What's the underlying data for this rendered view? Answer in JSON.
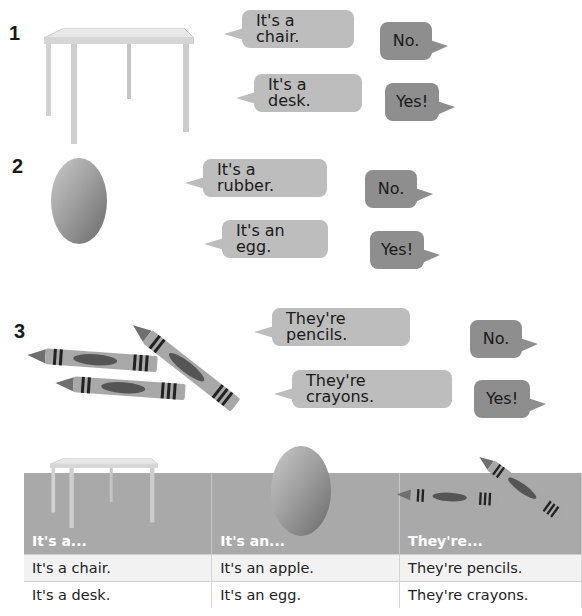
{
  "exercises": [
    {
      "number": "1",
      "object": "desk",
      "question_wrong": "It's a chair.",
      "answer_wrong": "No.",
      "question_right": "It's a desk.",
      "answer_right": "Yes!"
    },
    {
      "number": "2",
      "object": "egg",
      "question_wrong": "It's a rubber.",
      "answer_wrong": "No.",
      "question_right": "It's an egg.",
      "answer_right": "Yes!"
    },
    {
      "number": "3",
      "object": "crayons",
      "question_wrong": "They're pencils.",
      "answer_wrong": "No.",
      "question_right": "They're crayons.",
      "answer_right": "Yes!"
    }
  ],
  "grammar_table": {
    "headers": [
      "It's a...",
      "It's an...",
      "They're..."
    ],
    "rows": [
      [
        "It's a chair.",
        "It's an apple.",
        "They're pencils."
      ],
      [
        "It's a desk.",
        "It's an egg.",
        "They're crayons."
      ]
    ]
  },
  "colors": {
    "question_bubble": "#bdbdbd",
    "answer_bubble": "#8e8e8e",
    "table_header": "#a9a9a9"
  }
}
